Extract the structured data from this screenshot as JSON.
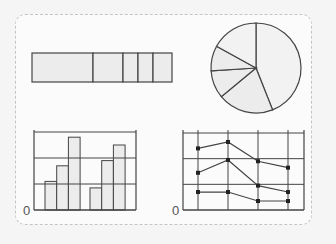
{
  "colors": {
    "background": "#f5f5f5",
    "panel": "#fbfbfb",
    "border_dashed": "#c4c4c4",
    "stroke": "#444444",
    "fill": "#ececec"
  },
  "labels": {
    "bar_origin": "0",
    "line_origin": "0"
  },
  "chart_data": [
    {
      "type": "bar",
      "variant": "stacked-horizontal-strip",
      "values": [
        61,
        30,
        15,
        15,
        19
      ],
      "title": "",
      "xlabel": "",
      "ylabel": ""
    },
    {
      "type": "pie",
      "values": [
        44,
        20,
        10,
        9,
        17
      ],
      "title": ""
    },
    {
      "type": "bar",
      "categories": [
        "A1",
        "A2",
        "A3",
        "B1",
        "B2",
        "B3"
      ],
      "values": [
        1.1,
        1.7,
        2.8,
        0.85,
        1.9,
        2.5
      ],
      "ylim": [
        0,
        3
      ],
      "grid": true,
      "ytick_labels": [
        "0"
      ],
      "title": "",
      "xlabel": "",
      "ylabel": ""
    },
    {
      "type": "line",
      "x": [
        1,
        2,
        3,
        4
      ],
      "series": [
        {
          "name": "series-1",
          "values": [
            2.4,
            2.65,
            1.9,
            1.65
          ]
        },
        {
          "name": "series-2",
          "values": [
            1.45,
            1.95,
            0.95,
            0.7
          ]
        },
        {
          "name": "series-3",
          "values": [
            0.7,
            0.7,
            0.35,
            0.35
          ]
        }
      ],
      "ylim": [
        0,
        3
      ],
      "grid": true,
      "ytick_labels": [
        "0"
      ],
      "title": "",
      "xlabel": "",
      "ylabel": ""
    }
  ]
}
